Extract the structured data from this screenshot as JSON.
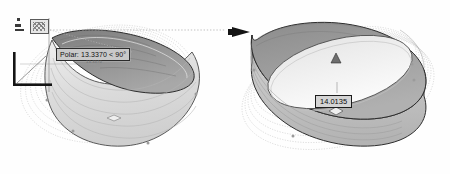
{
  "app": {
    "context": "cad-3d-modeling-viewport",
    "background_color": "#ffffff"
  },
  "left_panel": {
    "name": "stretch-in-progress-view",
    "tooltip": {
      "label": "Polar: 13.3370 < 90°",
      "sub_label": "13.3370",
      "background_color": "#c9c9c9",
      "border_color": "#2b2b2b",
      "text_color": "#101010"
    },
    "snap_icon": {
      "name": "object-snap-marker",
      "glyph": "▦"
    },
    "ucs_icon": {
      "name": "ucs-corner-marker",
      "color": "#1a1a1a"
    },
    "grips": [
      {
        "name": "diamond-grip",
        "shape": "diamond"
      }
    ],
    "tracking_line": {
      "style": "dotted",
      "color": "#9a9a9a"
    },
    "solid": {
      "name": "elliptical-ring-stretched",
      "fill_top": "#8e8e8e",
      "fill_side": "#d8d8d8",
      "edge_color": "#3a3a3a"
    }
  },
  "right_panel": {
    "name": "result-view",
    "dimension": {
      "label": "14.0135",
      "background_color": "#d4d4d4",
      "border_color": "#1c1c1c",
      "text_color": "#0d0d0d"
    },
    "arrow_marker": {
      "name": "direction-arrow",
      "color": "#141414"
    },
    "grips": [
      {
        "name": "triangle-grip",
        "shape": "triangle"
      },
      {
        "name": "diamond-grip",
        "shape": "diamond"
      }
    ],
    "solid": {
      "name": "elliptical-ring",
      "fill_top": "#9a9a9a",
      "fill_side": "#c4c4c4",
      "edge_color": "#2e2e2e"
    },
    "ghost_trails": {
      "name": "concentric-dotted-ellipses",
      "count": 7,
      "color": "#bdbdbd"
    }
  }
}
